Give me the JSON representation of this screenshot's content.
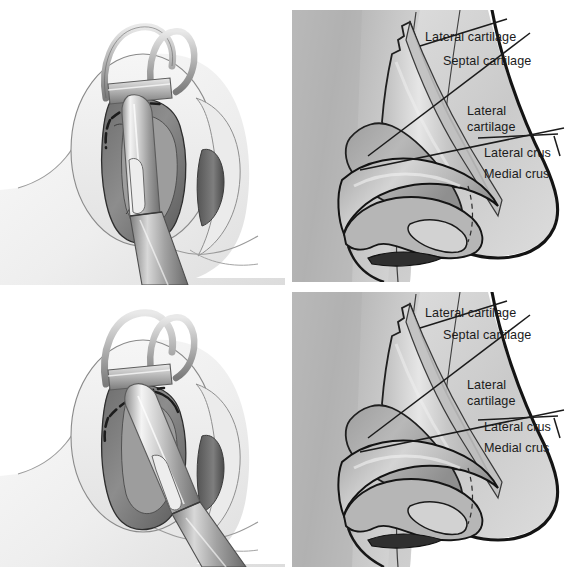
{
  "figure": {
    "panels": [
      {
        "id": "top-left",
        "name": "nostril-with-retractor-and-elevator-top",
        "description": "Nostril held open by a double-prong skin hook retractor with a dissecting elevator inserted vertically; dashed incision line marked on the vestibular skin"
      },
      {
        "id": "top-right",
        "name": "nasal-cartilage-anatomy-top",
        "description": "Lateral view of nose showing underlying cartilage framework with leader lines to labels"
      },
      {
        "id": "bottom-left",
        "name": "nostril-with-retractor-and-elevator-bottom",
        "description": "Nostril held open by a double-prong skin hook retractor with the elevator angled obliquely along the incision; dashed incision line marked"
      },
      {
        "id": "bottom-right",
        "name": "nasal-cartilage-anatomy-bottom",
        "description": "Lateral view of nose showing underlying cartilage framework with leader lines to labels"
      }
    ]
  },
  "labels": {
    "lateral_cartilage": "Lateral cartilage",
    "septal_cartilage": "Septal cartilage",
    "lateral_cartilage_l1": "Lateral",
    "lateral_cartilage_l2": "cartilage",
    "lateral_crus": "Lateral crus",
    "medial_crus": "Medial crus"
  },
  "colors": {
    "text": "#1b1b1b",
    "leader_line": "#1b1b1b",
    "outline_heavy": "#141414",
    "outline_light": "#4a4a4a",
    "skin_light": "#f2f2f2",
    "skin_mid": "#dcdcdc",
    "cartilage_light": "#d3d3d3",
    "cartilage_mid": "#b4b4b4",
    "cartilage_dark": "#8e8e8e",
    "photo_bg_light": "#cfcfcf",
    "photo_bg_mid": "#b8b8b8",
    "photo_bg_dark": "#9a9a9a",
    "steel_light": "#efefef",
    "steel_mid": "#b9b9b9",
    "steel_dark": "#6f6f6f",
    "nostril_shadow": "#3b3b3b",
    "page_bg": "#ffffff"
  },
  "geometry": {
    "width": 573,
    "height": 567,
    "panel_top_left": {
      "x": 0,
      "y": 0,
      "w": 285,
      "h": 285
    },
    "panel_top_right": {
      "x": 292,
      "y": 10,
      "w": 281,
      "h": 272
    },
    "panel_bottom_left": {
      "x": 0,
      "y": 288,
      "w": 285,
      "h": 279
    },
    "panel_bottom_right": {
      "x": 292,
      "y": 292,
      "w": 281,
      "h": 275
    }
  }
}
